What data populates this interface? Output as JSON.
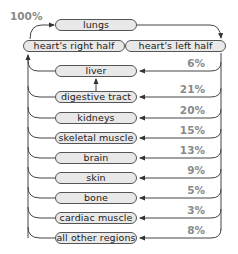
{
  "diagram": {
    "total_label": "100%",
    "lungs": "lungs",
    "heart_right": "heart's right half",
    "heart_left": "heart's left half",
    "colors": {
      "box_fill": "#e8e8e8",
      "box_border": "#555555",
      "percent_text": "#8a8a8a",
      "line": "#444444"
    },
    "organs": [
      {
        "label": "liver",
        "percent": "6%"
      },
      {
        "label": "digestive tract",
        "percent": "21%"
      },
      {
        "label": "kidneys",
        "percent": "20%"
      },
      {
        "label": "skeletal muscle",
        "percent": "15%"
      },
      {
        "label": "brain",
        "percent": "13%"
      },
      {
        "label": "skin",
        "percent": "9%"
      },
      {
        "label": "bone",
        "percent": "5%"
      },
      {
        "label": "cardiac muscle",
        "percent": "3%"
      },
      {
        "label": "all other regions",
        "percent": "8%"
      }
    ]
  }
}
